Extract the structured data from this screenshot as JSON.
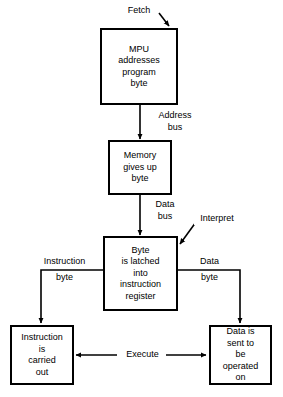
{
  "diagram": {
    "stroke_color": "#000000",
    "background_color": "#ffffff",
    "nodes": [
      {
        "id": "mpu",
        "name": "mpu-addresses-program-byte-box",
        "lines": [
          "MPU",
          "addresses",
          "program",
          "byte"
        ]
      },
      {
        "id": "memory",
        "name": "memory-gives-up-byte-box",
        "lines": [
          "Memory",
          "gives up",
          "byte"
        ]
      },
      {
        "id": "latch",
        "name": "byte-latched-into-instruction-register-box",
        "lines": [
          "Byte",
          "is latched",
          "into",
          "instruction",
          "register"
        ]
      },
      {
        "id": "instruction",
        "name": "instruction-is-carried-out-box",
        "lines": [
          "Instruction",
          "is",
          "carried",
          "out"
        ]
      },
      {
        "id": "data",
        "name": "data-is-sent-to-be-operated-on-box",
        "lines": [
          "Data is",
          "sent to",
          "be",
          "operated",
          "on"
        ]
      }
    ],
    "labels": {
      "fetch": "Fetch",
      "address_bus_line1": "Address",
      "address_bus_line2": "bus",
      "data_bus_line1": "Data",
      "data_bus_line2": "bus",
      "interpret": "Interpret",
      "instruction_branch_line1": "Instruction",
      "instruction_branch_line2": "byte",
      "data_branch_line1": "Data",
      "data_branch_line2": "byte",
      "execute": "Execute"
    }
  }
}
